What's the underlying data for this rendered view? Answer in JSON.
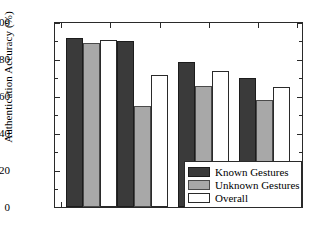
{
  "chart_data": {
    "type": "bar",
    "title": "",
    "xlabel": "",
    "ylabel": "Authentication Accuracy (%)",
    "ylim": [
      0,
      100
    ],
    "yticks": [
      0,
      20,
      40,
      60,
      80,
      100
    ],
    "ytick_labels": [
      "0",
      "20",
      "40",
      "60",
      "80",
      "100"
    ],
    "yminor_step": 5,
    "grid": false,
    "legend_position": "lower right",
    "categories": [
      "Group 1",
      "Group 2",
      "Group 3",
      "Group 4"
    ],
    "xtick_labels": [
      "",
      "",
      "",
      ""
    ],
    "series": [
      {
        "name": "Known Gestures",
        "color": "#3a3a3a",
        "values": [
          92,
          90,
          79,
          70
        ]
      },
      {
        "name": "Unknown Gestures",
        "color": "#a8a8a8",
        "values": [
          89,
          55,
          66,
          58
        ]
      },
      {
        "name": "Overall",
        "color": "#ffffff",
        "values": [
          90.5,
          72,
          74,
          65
        ]
      }
    ]
  },
  "axis": {
    "y_title": "Authentication Accuracy (%)",
    "y_labels": {
      "t0": "0",
      "t20": "20",
      "t40": "40",
      "t60": "60",
      "t80": "80",
      "t100": "100"
    }
  },
  "legend": {
    "items": [
      {
        "label": "Known Gestures",
        "swatch": "known"
      },
      {
        "label": "Unknown Gestures",
        "swatch": "unknown"
      },
      {
        "label": "Overall",
        "swatch": "overall"
      }
    ]
  }
}
